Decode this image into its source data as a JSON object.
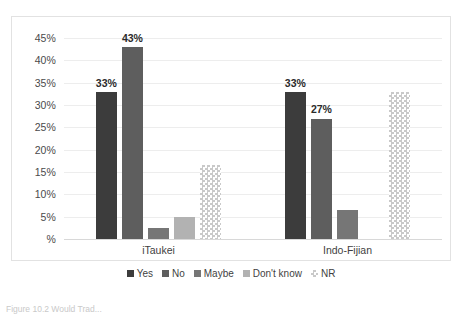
{
  "chart_data": {
    "type": "bar",
    "title": "",
    "xlabel": "",
    "ylabel": "",
    "categories": [
      "iTaukei",
      "Indo-Fijian"
    ],
    "series": [
      {
        "name": "Yes",
        "color": "#3c3c3c",
        "values": [
          33,
          33
        ],
        "labels": [
          "33%",
          "33%"
        ]
      },
      {
        "name": "No",
        "color": "#5e5e5e",
        "values": [
          43,
          27
        ],
        "labels": [
          "43%",
          "27%"
        ]
      },
      {
        "name": "Maybe",
        "color": "#767676",
        "values": [
          2.5,
          6.5
        ],
        "labels": [
          "",
          ""
        ]
      },
      {
        "name": "Don't know",
        "color": "#b2b2b2",
        "values": [
          5,
          0
        ],
        "labels": [
          "",
          ""
        ]
      },
      {
        "name": "NR",
        "color": "#c9c9c9",
        "pattern": "checker",
        "values": [
          16.5,
          33
        ],
        "labels": [
          "",
          ""
        ]
      }
    ],
    "ylim": [
      0,
      47.5
    ],
    "yticks": [
      0,
      5,
      10,
      15,
      20,
      25,
      30,
      35,
      40,
      45
    ],
    "ytick_labels": [
      "%",
      "5%",
      "10%",
      "15%",
      "20%",
      "25%",
      "30%",
      "35%",
      "40%",
      "45%"
    ],
    "grid": true,
    "legend_position": "bottom",
    "plot_border": true
  },
  "axis": {
    "y_ticks": [
      {
        "value": 45,
        "label": "45%"
      },
      {
        "value": 40,
        "label": "40%"
      },
      {
        "value": 35,
        "label": "35%"
      },
      {
        "value": 30,
        "label": "30%"
      },
      {
        "value": 25,
        "label": "25%"
      },
      {
        "value": 20,
        "label": "20%"
      },
      {
        "value": 15,
        "label": "15%"
      },
      {
        "value": 10,
        "label": "10%"
      },
      {
        "value": 5,
        "label": "5%"
      },
      {
        "value": 0,
        "label": "%"
      }
    ],
    "categories": [
      "iTaukei",
      "Indo-Fijian"
    ]
  },
  "legend": {
    "items": [
      {
        "label": "Yes",
        "swatch": "legend-swatch-yes"
      },
      {
        "label": "No",
        "swatch": "legend-swatch-no"
      },
      {
        "label": "Maybe",
        "swatch": "legend-swatch-maybe"
      },
      {
        "label": "Don't know",
        "swatch": "legend-swatch-dontknow"
      },
      {
        "label": "NR",
        "swatch": "legend-swatch-nr"
      }
    ]
  },
  "caption": {
    "text": "Figure 10.2  Would Trad..."
  }
}
